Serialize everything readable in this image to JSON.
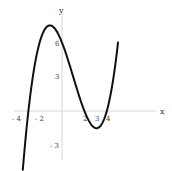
{
  "chart_data": {
    "type": "line",
    "title": "",
    "xlabel": "x",
    "ylabel": "y",
    "function": "f(x) = 0.25 (x + 3)(x - 2)(x - 4)",
    "x_ticks": [
      -4,
      -2,
      2,
      3,
      4
    ],
    "y_ticks": [
      6,
      3,
      -3
    ],
    "x_tick_labels": [
      "- 4",
      "- 2",
      "2",
      "3",
      "4"
    ],
    "y_tick_labels": [
      "6",
      "3",
      "- 3"
    ],
    "xlim": [
      -5.5,
      8.5
    ],
    "ylim": [
      -5.2,
      9.2
    ],
    "grid": false,
    "legend": null,
    "series": [
      {
        "name": "f(x)",
        "color": "#111111",
        "x": [
          -3.5,
          -3,
          -2.5,
          -2,
          -1.5,
          -1,
          -0.5,
          0,
          0.5,
          1,
          1.5,
          2,
          2.5,
          3,
          3.5,
          4,
          4.5,
          5
        ],
        "y": [
          -4.59,
          0,
          3.42,
          6.0,
          7.31,
          7.5,
          6.84,
          6.0,
          4.59,
          3.0,
          1.42,
          0,
          -1.08,
          -1.5,
          -1.5,
          0,
          1.69,
          4.0
        ]
      }
    ],
    "roots": [
      -3,
      2,
      4
    ],
    "local_max": {
      "x": -1.38,
      "y": 7.36
    },
    "local_min": {
      "x": 3.38,
      "y": -1.37
    }
  },
  "axes": {
    "x_title": "x",
    "y_title": "y"
  }
}
